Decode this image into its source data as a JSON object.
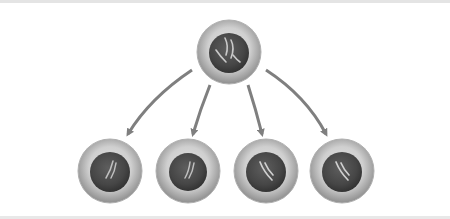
{
  "diagram": {
    "title": "Cell division: one parent cell produces four daughter cells",
    "colors": {
      "background": "#ffffff",
      "border": "#e4e4e4",
      "cytoplasm_light": "#d4d4d4",
      "cytoplasm_dark": "#9a9a9a",
      "nucleus_dark": "#3f3f3f",
      "nucleus_mid": "#5a5a5a",
      "chromosome": "#c8c8c8",
      "arrow": "#7f7f7f"
    },
    "parent_cell": {
      "label": "parent cell",
      "cx": 229,
      "cy": 52,
      "r": 32,
      "nucleus_r": 20
    },
    "daughter_cells": [
      {
        "label": "daughter cell 1",
        "cx": 110,
        "cy": 171,
        "r": 32,
        "nucleus_r": 20
      },
      {
        "label": "daughter cell 2",
        "cx": 188,
        "cy": 171,
        "r": 32,
        "nucleus_r": 19
      },
      {
        "label": "daughter cell 3",
        "cx": 266,
        "cy": 171,
        "r": 32,
        "nucleus_r": 20
      },
      {
        "label": "daughter cell 4",
        "cx": 342,
        "cy": 171,
        "r": 32,
        "nucleus_r": 20
      }
    ],
    "arrows": [
      {
        "label": "arrow to daughter cell 1",
        "from": [
          192,
          70
        ],
        "to": [
          128,
          134
        ]
      },
      {
        "label": "arrow to daughter cell 2",
        "from": [
          210,
          85
        ],
        "to": [
          193,
          134
        ]
      },
      {
        "label": "arrow to daughter cell 3",
        "from": [
          248,
          85
        ],
        "to": [
          262,
          134
        ]
      },
      {
        "label": "arrow to daughter cell 4",
        "from": [
          266,
          70
        ],
        "to": [
          326,
          134
        ]
      }
    ]
  }
}
